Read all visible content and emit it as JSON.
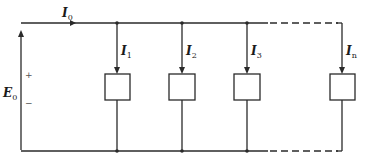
{
  "diagram": {
    "type": "parallel-circuit",
    "source": {
      "label": "E",
      "subscript": "0",
      "plus": "+",
      "minus": "−"
    },
    "supply_current": {
      "label": "I",
      "subscript": "0"
    },
    "branches": [
      {
        "label": "I",
        "subscript": "1"
      },
      {
        "label": "I",
        "subscript": "2"
      },
      {
        "label": "I",
        "subscript": "3"
      },
      {
        "label": "I",
        "subscript": "n"
      }
    ],
    "colors": {
      "line": "#2a2a2a",
      "background": "#ffffff"
    }
  }
}
